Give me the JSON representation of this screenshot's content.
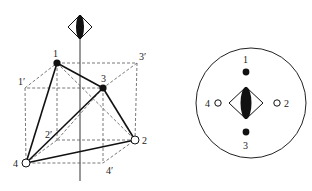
{
  "figure": {
    "left_panel": {
      "description": "Tetrahedral arrangement inscribed in a cube with a vertical S4 improper rotation axis",
      "axis_symbol": "S4-diamond-with-lens",
      "points": [
        {
          "id": "1",
          "label": "1",
          "filled": true
        },
        {
          "id": "2",
          "label": "2",
          "filled": false
        },
        {
          "id": "3",
          "label": "3",
          "filled": true
        },
        {
          "id": "4",
          "label": "4",
          "filled": false
        }
      ],
      "primed_labels": [
        {
          "id": "1p",
          "label": "1′"
        },
        {
          "id": "2p",
          "label": "2′"
        },
        {
          "id": "3p",
          "label": "3′"
        },
        {
          "id": "4p",
          "label": "4′"
        }
      ]
    },
    "right_panel": {
      "description": "Stereographic projection along the S4 axis",
      "axis_symbol": "S4-diamond-with-lens",
      "points": [
        {
          "id": "1",
          "label": "1",
          "filled": true,
          "position": "top"
        },
        {
          "id": "3",
          "label": "3",
          "filled": true,
          "position": "bottom"
        },
        {
          "id": "4",
          "label": "4",
          "filled": false,
          "position": "left"
        },
        {
          "id": "2",
          "label": "2",
          "filled": false,
          "position": "right"
        }
      ]
    }
  }
}
